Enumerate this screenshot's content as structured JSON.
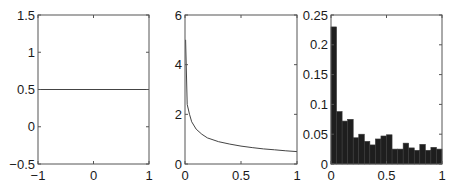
{
  "chart_data": [
    {
      "type": "line",
      "title": "",
      "xlabel": "",
      "ylabel": "",
      "xlim": [
        -1,
        1
      ],
      "ylim": [
        -0.5,
        1.5
      ],
      "xticks": [
        "-1",
        "0",
        "1"
      ],
      "yticks": [
        "-0.5",
        "0",
        "0.5",
        "1",
        "1.5"
      ],
      "grid": false,
      "series": [
        {
          "name": "constant",
          "x": [
            -1,
            1
          ],
          "y": [
            0.5,
            0.5
          ]
        }
      ]
    },
    {
      "type": "line",
      "title": "",
      "xlabel": "",
      "ylabel": "",
      "xlim": [
        0,
        1
      ],
      "ylim": [
        0,
        6
      ],
      "xticks": [
        "0",
        "0.5",
        "1"
      ],
      "yticks": [
        "0",
        "2",
        "4",
        "6"
      ],
      "grid": false,
      "series": [
        {
          "name": "decay",
          "x": [
            0.005,
            0.02,
            0.04,
            0.06,
            0.1,
            0.15,
            0.2,
            0.3,
            0.4,
            0.5,
            0.6,
            0.7,
            0.8,
            0.9,
            1.0
          ],
          "y": [
            5.0,
            2.4,
            2.0,
            1.7,
            1.4,
            1.2,
            1.05,
            0.9,
            0.8,
            0.72,
            0.66,
            0.61,
            0.57,
            0.53,
            0.5
          ]
        }
      ]
    },
    {
      "type": "bar",
      "title": "",
      "xlabel": "",
      "ylabel": "",
      "xlim": [
        0,
        1
      ],
      "ylim": [
        0,
        0.25
      ],
      "xticks": [
        "0",
        "0.5",
        "1"
      ],
      "yticks": [
        "0",
        "0.05",
        "0.1",
        "0.15",
        "0.2",
        "0.25"
      ],
      "grid": false,
      "bin_edges": [
        0,
        0.05,
        0.1,
        0.15,
        0.2,
        0.25,
        0.3,
        0.35,
        0.4,
        0.45,
        0.5,
        0.55,
        0.6,
        0.65,
        0.7,
        0.75,
        0.8,
        0.85,
        0.9,
        0.95,
        1.0
      ],
      "values": [
        0.23,
        0.088,
        0.072,
        0.075,
        0.044,
        0.05,
        0.038,
        0.032,
        0.042,
        0.047,
        0.049,
        0.025,
        0.025,
        0.035,
        0.027,
        0.023,
        0.033,
        0.023,
        0.028,
        0.025
      ],
      "bar_color": "#1e1e1e"
    }
  ],
  "colors": {
    "axis": "#555555",
    "line": "#444444",
    "bar": "#1e1e1e",
    "bar_edge": "#3a3a3a"
  }
}
